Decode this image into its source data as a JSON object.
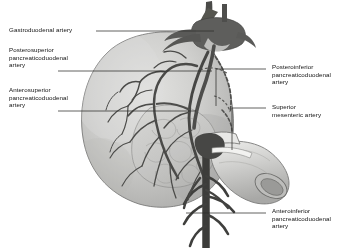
{
  "figure": {
    "style": "grayscale anatomical line illustration",
    "colors": {
      "background": "#ffffff",
      "organ_fill_light": "#d8d8d6",
      "organ_fill_mid": "#c2c2c0",
      "organ_fill_dark": "#a9a9a7",
      "duodenum_fill": "#cfcfcd",
      "vessel_dark": "#5a5a58",
      "vessel_darker": "#3f3f3e",
      "outline": "#6b6b69",
      "leader_line": "#3a3a38",
      "text": "#111111"
    }
  },
  "labels": {
    "gastroduodenal": {
      "text": "Gastroduodenal artery",
      "side": "left",
      "lines": 1
    },
    "posterosuperior": {
      "text": "Posterosuperior\npancreaticoduodenal\nartery",
      "side": "left",
      "lines": 3
    },
    "anterosuperior": {
      "text": "Anterosuperior\npancreaticoduodenal\nartery",
      "side": "left",
      "lines": 3
    },
    "posteroinferior": {
      "text": "Posteroinferior\npancreaticoduodenal\nartery",
      "side": "right",
      "lines": 3
    },
    "superior_mesenteric": {
      "text": "Superior\nmesenteric artery",
      "side": "right",
      "lines": 2
    },
    "anteroinferior": {
      "text": "Anteroinferior\npancreaticoduodenal\nartery",
      "side": "right",
      "lines": 3
    }
  },
  "structures": {
    "pancreas_head": "pancreatic head with lobulated parenchyma",
    "duodenum": "C-loop of duodenum, cut distal end showing open lumen",
    "celiac_trunk": "dark vessel trunk crossing superiorly",
    "arcades": "anterior and posterior pancreaticoduodenal arterial arcades"
  }
}
